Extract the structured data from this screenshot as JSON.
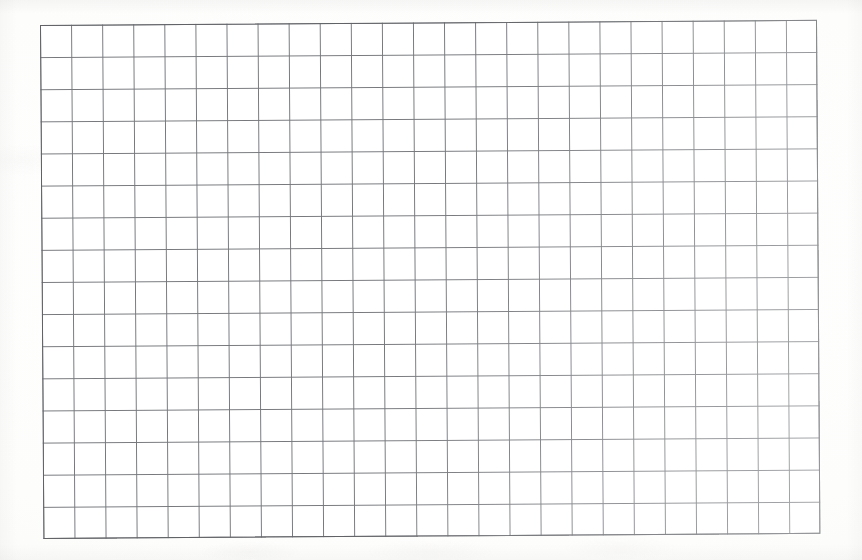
{
  "document": {
    "title": "Blank grid paper scan",
    "kind": "scanned-graph-paper",
    "caption": "",
    "page_width_px": 862,
    "page_height_px": 560,
    "page_background_color": "#fefefe",
    "has_text": false,
    "text_content": "",
    "annotations": []
  },
  "grid": {
    "label": "Empty ruled grid",
    "columns": 25,
    "rows": 16,
    "cell_width_px": 31.08,
    "cell_height_px": 32.13,
    "left_px": 40,
    "top_px": 25,
    "width_px": 778,
    "height_px": 514,
    "line_color": "#76787c",
    "border_color": "#606266",
    "cell_fill_color": "#ffffff",
    "line_width_px": 1,
    "rotation_deg": -0.38,
    "cells_filled": 0,
    "cell_values": []
  },
  "scan_artifacts": {
    "paper_tone_color": "#fdfdfc",
    "edge_shadow_color": "rgba(0,0,0,0.03)",
    "bleed_through_color": "rgba(172,168,162,0.12)",
    "bleed_through_note": "faint ghosting from reverse side of sheet",
    "bottom_smudge_note": "soft shadow band below grid"
  }
}
